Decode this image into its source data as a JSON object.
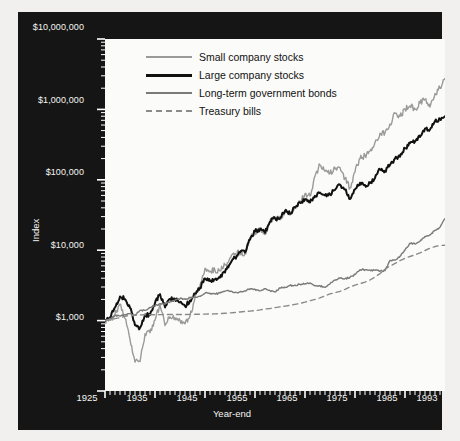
{
  "chart_data": {
    "type": "line",
    "title": "",
    "xlabel": "Year-end",
    "ylabel": "Index",
    "xlim": [
      1925,
      1993
    ],
    "ylim": [
      100,
      10000000
    ],
    "yscale": "log",
    "grid": false,
    "legend_position": "top-left",
    "xticks": [
      "1925",
      "1935",
      "1945",
      "1955",
      "1965",
      "1975",
      "1985",
      "1993"
    ],
    "xtick_values": [
      1925,
      1935,
      1945,
      1955,
      1965,
      1975,
      1985,
      1993
    ],
    "yticks": [
      "$1,000",
      "$10,000",
      "$100,000",
      "$1,000,000",
      "$10,000,000"
    ],
    "ytick_values": [
      1000,
      10000,
      100000,
      1000000,
      10000000
    ],
    "x": [
      1925,
      1926,
      1927,
      1928,
      1929,
      1930,
      1931,
      1932,
      1933,
      1934,
      1935,
      1936,
      1937,
      1938,
      1939,
      1940,
      1941,
      1942,
      1943,
      1944,
      1945,
      1946,
      1947,
      1948,
      1949,
      1950,
      1951,
      1952,
      1953,
      1954,
      1955,
      1956,
      1957,
      1958,
      1959,
      1960,
      1961,
      1962,
      1963,
      1964,
      1965,
      1966,
      1967,
      1968,
      1969,
      1970,
      1971,
      1972,
      1973,
      1974,
      1975,
      1976,
      1977,
      1978,
      1979,
      1980,
      1981,
      1982,
      1983,
      1984,
      1985,
      1986,
      1987,
      1988,
      1989,
      1990,
      1991,
      1992,
      1993
    ],
    "series": [
      {
        "name": "Small company stocks",
        "color": "#9a9a9a",
        "style": "solid",
        "width": 1.4,
        "end_label": "$2,757,150",
        "end_value": 2757150,
        "values": [
          1000,
          1007,
          1230,
          1720,
          1076,
          540,
          257,
          262,
          650,
          670,
          1010,
          1700,
          850,
          1130,
          1100,
          1010,
          900,
          1160,
          2090,
          3160,
          5550,
          5050,
          5170,
          5090,
          6200,
          7800,
          9000,
          9300,
          8900,
          14900,
          18200,
          19500,
          16700,
          26200,
          28600,
          27200,
          36200,
          31600,
          39600,
          47900,
          63500,
          58700,
          113000,
          162000,
          132000,
          123000,
          143000,
          150000,
          105000,
          77000,
          130000,
          200000,
          221000,
          256000,
          340000,
          460000,
          464000,
          620000,
          880000,
          800000,
          1000000,
          1120000,
          1000000,
          1230000,
          1380000,
          1080000,
          1680000,
          2010000,
          2757150
        ]
      },
      {
        "name": "Large company stocks",
        "color": "#111111",
        "style": "solid",
        "width": 2.0,
        "end_label": "$800,080",
        "end_value": 800080,
        "values": [
          1000,
          1116,
          1535,
          2204,
          2018,
          1516,
          860,
          791,
          1217,
          1200,
          1772,
          2373,
          1540,
          2021,
          2012,
          1815,
          1605,
          1930,
          2430,
          2909,
          3973,
          3651,
          3860,
          4071,
          4829,
          6361,
          7888,
          9336,
          9241,
          14100,
          18560,
          19780,
          17650,
          25330,
          28370,
          28510,
          36160,
          33000,
          40530,
          47200,
          53100,
          47760,
          59200,
          65740,
          60180,
          62550,
          71480,
          85070,
          72580,
          53350,
          73220,
          90740,
          84250,
          89790,
          106400,
          140900,
          134000,
          162900,
          199700,
          212200,
          279600,
          331600,
          349000,
          407000,
          536000,
          519000,
          677000,
          729000,
          800080
        ]
      },
      {
        "name": "Long-term government bonds",
        "color": "#7a7a7a",
        "style": "solid",
        "width": 1.4,
        "end_label": "$28,030",
        "end_value": 28030,
        "values": [
          1000,
          1078,
          1175,
          1165,
          1204,
          1260,
          1194,
          1396,
          1398,
          1538,
          1616,
          1737,
          1741,
          1838,
          1944,
          2051,
          2043,
          2108,
          2152,
          2213,
          2452,
          2450,
          2385,
          2466,
          2623,
          2620,
          2519,
          2547,
          2640,
          2832,
          2794,
          2643,
          2836,
          2664,
          2563,
          2912,
          2939,
          3145,
          3180,
          3291,
          3309,
          3428,
          3130,
          3121,
          2963,
          3333,
          3785,
          3998,
          3951,
          4125,
          4512,
          5294,
          5290,
          5230,
          5190,
          5025,
          5120,
          7160,
          7230,
          8210,
          10080,
          12540,
          12200,
          13440,
          15640,
          16550,
          19220,
          21170,
          28030
        ]
      },
      {
        "name": "Treasury bills",
        "color": "#8a8a8a",
        "style": "dashed",
        "width": 1.4,
        "end_label": "$11,730",
        "end_value": 11730,
        "values": [
          1000,
          1033,
          1065,
          1100,
          1152,
          1180,
          1193,
          1204,
          1208,
          1211,
          1213,
          1215,
          1219,
          1219,
          1219,
          1219,
          1220,
          1224,
          1228,
          1232,
          1236,
          1240,
          1246,
          1257,
          1271,
          1286,
          1305,
          1327,
          1351,
          1363,
          1384,
          1418,
          1462,
          1484,
          1529,
          1569,
          1603,
          1646,
          1699,
          1758,
          1827,
          1913,
          2003,
          2107,
          2248,
          2395,
          2500,
          2596,
          2779,
          2999,
          3184,
          3348,
          3520,
          3773,
          4169,
          4659,
          5364,
          5951,
          6474,
          7126,
          7676,
          8148,
          8595,
          9141,
          9903,
          10674,
          11269,
          11664,
          11730
        ]
      }
    ]
  },
  "axes": {
    "y_title": "Index",
    "x_title": "Year-end"
  },
  "legend": {
    "items": [
      {
        "label": "Small company stocks",
        "color": "#9a9a9a",
        "style": "solid",
        "width": "2.2px"
      },
      {
        "label": "Large company stocks",
        "color": "#111111",
        "style": "solid",
        "width": "3.2px"
      },
      {
        "label": "Long-term government bonds",
        "color": "#7a7a7a",
        "style": "solid",
        "width": "2.2px"
      },
      {
        "label": "Treasury bills",
        "color": "#8a8a8a",
        "style": "dashed",
        "width": "2px"
      }
    ]
  },
  "end_labels": [
    {
      "text": "$2,757,150",
      "name": "end-label-small-company-stocks"
    },
    {
      "text": "$800,080",
      "name": "end-label-large-company-stocks"
    },
    {
      "text": "$28,030",
      "name": "end-label-long-term-government-bonds"
    },
    {
      "text": "$11,730",
      "name": "end-label-treasury-bills"
    }
  ],
  "ytick_labels": [
    "$10,000,000",
    "$1,000,000",
    "$100,000",
    "$10,000",
    "$1,000"
  ],
  "xtick_labels": [
    "1925",
    "1935",
    "1945",
    "1955",
    "1965",
    "1975",
    "1985",
    "1993"
  ]
}
